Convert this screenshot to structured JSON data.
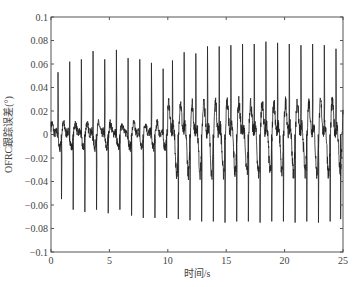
{
  "chart_data": {
    "type": "line",
    "title": "",
    "xlabel": "时间/s",
    "ylabel": "OFRC跟踪误差(°)",
    "xlim": [
      0,
      25
    ],
    "ylim": [
      -0.1,
      0.1
    ],
    "xticks": [
      0,
      5,
      10,
      15,
      20,
      25
    ],
    "xtick_labels": [
      "0",
      "5",
      "10",
      "15",
      "20",
      "25"
    ],
    "yticks": [
      0.1,
      0.08,
      0.06,
      0.04,
      0.02,
      0,
      -0.02,
      -0.04,
      -0.06,
      -0.08,
      -0.1
    ],
    "ytick_labels": [
      "0.1",
      "0.08",
      "0.06",
      "0.04",
      "0.02",
      "0",
      "−0.02",
      "−0.04",
      "−0.06",
      "−0.08",
      "−0.1"
    ],
    "grid": false,
    "legend": null,
    "series": [
      {
        "name": "OFRC tracking error",
        "color": "#222222",
        "period_s": 1.0,
        "baseline_amplitude_early": 0.012,
        "baseline_amplitude_late": 0.035,
        "transition_time_s": 10,
        "positive_spikes": [
          {
            "t": 0.6,
            "v": 0.053
          },
          {
            "t": 1.6,
            "v": 0.062
          },
          {
            "t": 2.6,
            "v": 0.064
          },
          {
            "t": 3.6,
            "v": 0.071
          },
          {
            "t": 4.6,
            "v": 0.064
          },
          {
            "t": 5.6,
            "v": 0.072
          },
          {
            "t": 6.6,
            "v": 0.065
          },
          {
            "t": 7.6,
            "v": 0.064
          },
          {
            "t": 8.6,
            "v": 0.061
          },
          {
            "t": 9.6,
            "v": 0.056
          },
          {
            "t": 10.4,
            "v": 0.063
          },
          {
            "t": 11.4,
            "v": 0.07
          },
          {
            "t": 12.4,
            "v": 0.069
          },
          {
            "t": 13.4,
            "v": 0.075
          },
          {
            "t": 14.4,
            "v": 0.075
          },
          {
            "t": 15.4,
            "v": 0.076
          },
          {
            "t": 16.4,
            "v": 0.077
          },
          {
            "t": 17.4,
            "v": 0.077
          },
          {
            "t": 18.4,
            "v": 0.079
          },
          {
            "t": 19.4,
            "v": 0.078
          },
          {
            "t": 20.4,
            "v": 0.077
          },
          {
            "t": 21.4,
            "v": 0.076
          },
          {
            "t": 22.4,
            "v": 0.077
          },
          {
            "t": 23.4,
            "v": 0.076
          },
          {
            "t": 24.4,
            "v": 0.073
          }
        ],
        "negative_spikes": [
          {
            "t": 0.9,
            "v": -0.055
          },
          {
            "t": 1.9,
            "v": -0.064
          },
          {
            "t": 2.9,
            "v": -0.066
          },
          {
            "t": 3.9,
            "v": -0.064
          },
          {
            "t": 4.9,
            "v": -0.067
          },
          {
            "t": 5.9,
            "v": -0.064
          },
          {
            "t": 6.9,
            "v": -0.069
          },
          {
            "t": 7.9,
            "v": -0.071
          },
          {
            "t": 8.9,
            "v": -0.071
          },
          {
            "t": 9.9,
            "v": -0.071
          },
          {
            "t": 10.9,
            "v": -0.072
          },
          {
            "t": 11.9,
            "v": -0.073
          },
          {
            "t": 12.9,
            "v": -0.074
          },
          {
            "t": 13.9,
            "v": -0.074
          },
          {
            "t": 14.9,
            "v": -0.075
          },
          {
            "t": 15.9,
            "v": -0.074
          },
          {
            "t": 16.9,
            "v": -0.074
          },
          {
            "t": 17.9,
            "v": -0.075
          },
          {
            "t": 18.9,
            "v": -0.074
          },
          {
            "t": 19.9,
            "v": -0.074
          },
          {
            "t": 20.9,
            "v": -0.075
          },
          {
            "t": 21.9,
            "v": -0.074
          },
          {
            "t": 22.9,
            "v": -0.075
          },
          {
            "t": 23.9,
            "v": -0.074
          },
          {
            "t": 24.8,
            "v": -0.072
          }
        ]
      }
    ]
  },
  "layout": {
    "plot_left": 51,
    "plot_right": 343,
    "plot_top": 17,
    "plot_bottom": 252
  }
}
